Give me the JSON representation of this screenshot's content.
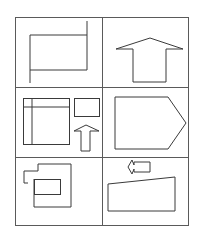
{
  "figure": {
    "title": "",
    "stroke_color": "#3a3a3a",
    "grid_color": "#5a5a5a",
    "background": "#ffffff",
    "grid": {
      "x": 15,
      "y": 17,
      "width": 173,
      "height": 208,
      "column_divider_x": 102,
      "row_divider_ys": [
        87,
        157
      ],
      "rows": 3,
      "columns": 2
    },
    "cells": [
      {
        "id": "cell-1",
        "description": "rectangle with extended right and left edges",
        "shapes": [
          {
            "type": "polyline",
            "points": "30,35 30,83"
          },
          {
            "type": "polyline",
            "points": "30,35 87,35"
          },
          {
            "type": "polyline",
            "points": "30,70 87,70"
          },
          {
            "type": "polyline",
            "points": "87,21 87,70"
          }
        ]
      },
      {
        "id": "cell-2",
        "description": "large upward arrow",
        "shapes": [
          {
            "type": "polygon",
            "points": "133,82 166,82 166,49 183,49 150,38 116,49 133,49"
          }
        ]
      },
      {
        "id": "cell-3",
        "description": "square with cross lines, small rectangle, small upward arrow",
        "shapes": [
          {
            "type": "rect",
            "x": 23,
            "y": 98,
            "width": 46,
            "height": 46
          },
          {
            "type": "polyline",
            "points": "32,98 32,144"
          },
          {
            "type": "polyline",
            "points": "23,107 69,107"
          },
          {
            "type": "rect",
            "x": 74,
            "y": 98,
            "width": 25,
            "height": 18
          },
          {
            "type": "polygon",
            "points": "81,151 90,151 90,131 99,131 86,125 74,131 81,131"
          }
        ]
      },
      {
        "id": "cell-4",
        "description": "pentagon pointing right",
        "shapes": [
          {
            "type": "polygon",
            "points": "115,97 168,97 186,123 168,149 115,149"
          }
        ]
      },
      {
        "id": "cell-5",
        "description": "irregular outline with inner rectangle",
        "shapes": [
          {
            "type": "polyline",
            "points": "38,164 71,164 71,207 34,207 34,179"
          },
          {
            "type": "polyline",
            "points": "38,164 38,171 24,171 24,183 28,183"
          },
          {
            "type": "rect",
            "x": 34,
            "y": 179,
            "width": 26,
            "height": 15
          }
        ]
      },
      {
        "id": "cell-6",
        "description": "small left arrow above slanted quadrilateral",
        "shapes": [
          {
            "type": "polygon",
            "points": "134,165 134,162 150,162 150,172 134,172 134,169 132,174 128,167 132,160"
          },
          {
            "type": "polygon",
            "points": "108,184 175,177 175,211 108,211"
          }
        ]
      }
    ]
  }
}
